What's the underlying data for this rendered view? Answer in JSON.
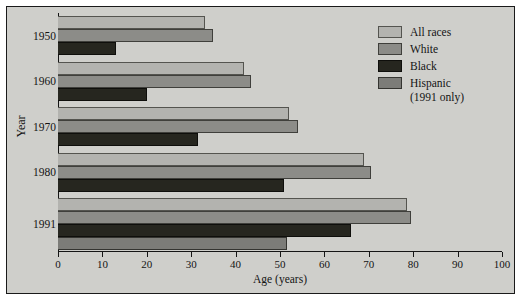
{
  "chart_data": {
    "type": "bar",
    "orientation": "horizontal",
    "title": "",
    "xlabel": "Age (years)",
    "ylabel": "Year",
    "xlim": [
      0,
      100
    ],
    "xticks": [
      0,
      10,
      20,
      30,
      40,
      50,
      60,
      70,
      80,
      90,
      100
    ],
    "categories": [
      "1950",
      "1960",
      "1970",
      "1980",
      "1991"
    ],
    "grid": false,
    "legend_position": "top-right",
    "series": [
      {
        "name": "All races",
        "color": "#b3b3af",
        "values": [
          33,
          42,
          52,
          69,
          78.5
        ]
      },
      {
        "name": "White",
        "color": "#8c8c88",
        "values": [
          35,
          43.5,
          54,
          70.5,
          79.5
        ]
      },
      {
        "name": "Black",
        "color": "#26261f",
        "values": [
          13,
          20,
          31.5,
          51,
          66
        ]
      },
      {
        "name": "Hispanic",
        "color": "#7c7c78",
        "values": [
          null,
          null,
          null,
          null,
          51.5
        ]
      }
    ]
  },
  "axes": {
    "x_title": "Age (years)",
    "y_title": "Year",
    "x_tick_labels": [
      "0",
      "10",
      "20",
      "30",
      "40",
      "50",
      "60",
      "70",
      "80",
      "90",
      "100"
    ],
    "y_tick_labels": [
      "1950",
      "1960",
      "1970",
      "1980",
      "1991"
    ]
  },
  "legend": {
    "items": [
      {
        "label": "All races",
        "sublabel": "",
        "swatch": "c-allraces"
      },
      {
        "label": "White",
        "sublabel": "",
        "swatch": "c-white"
      },
      {
        "label": "Black",
        "sublabel": "",
        "swatch": "c-black"
      },
      {
        "label": "Hispanic",
        "sublabel": "(1991 only)",
        "swatch": "c-hispanic"
      }
    ]
  }
}
